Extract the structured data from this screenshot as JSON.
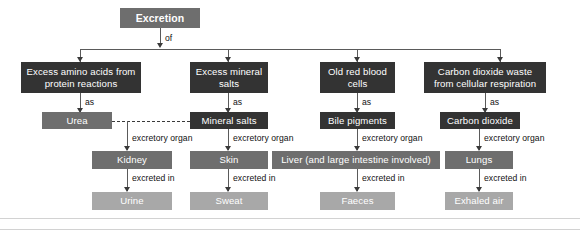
{
  "diagram": {
    "title": "Excretion",
    "root": {
      "label": "Excretion"
    },
    "root_connector_label": "of",
    "level2_connector_label": "as",
    "level3_connector_label": "excretory organ",
    "level4_connector_label": "excreted in",
    "colors": {
      "dark_box": "#333333",
      "mid_box": "#6e6e6e",
      "light_box": "#a8a8a8",
      "text": "#ffffff",
      "label_text": "#111111",
      "connector": "#5a5a5a",
      "background": "#ffffff"
    },
    "branches": [
      {
        "waste": "Excess amino acids from protein reactions",
        "substance": "Urea",
        "organ": "Kidney",
        "output": "Urine",
        "as_label": "as",
        "organ_label": "excretory organ",
        "excreted_label": "excreted in"
      },
      {
        "waste": "Excess mineral salts",
        "substance": "Mineral salts",
        "organ": "Skin",
        "output": "Sweat",
        "as_label": "as",
        "organ_label": "excretory organ",
        "excreted_label": "excreted in"
      },
      {
        "waste": "Old red blood cells",
        "substance": "Bile pigments",
        "organ": "Liver (and large intestine involved)",
        "output": "Faeces",
        "as_label": "as",
        "organ_label": "excretory organ",
        "excreted_label": "excreted in"
      },
      {
        "waste": "Carbon dioxide waste from cellular respiration",
        "substance": "Carbon dioxide",
        "organ": "Lungs",
        "output": "Exhaled air",
        "as_label": "as",
        "organ_label": "excretory organ",
        "excreted_label": "excreted in"
      }
    ]
  }
}
